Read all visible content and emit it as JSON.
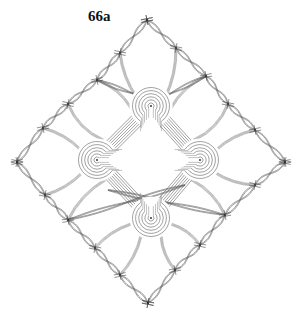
{
  "figure": {
    "label": "66a",
    "colors": {
      "background": "#ffffff",
      "thread": "#555555",
      "label": "#111111"
    }
  },
  "outline": {
    "top": [
      147,
      20
    ],
    "right": [
      285,
      162
    ],
    "bottom": [
      148,
      303
    ],
    "left": [
      17,
      162
    ]
  },
  "edges": {
    "top_right": [
      [
        147,
        20
      ],
      [
        176,
        48
      ],
      [
        206,
        76
      ],
      [
        228,
        104
      ],
      [
        255,
        130
      ],
      [
        285,
        162
      ]
    ],
    "top_left": [
      [
        147,
        20
      ],
      [
        120,
        53
      ],
      [
        97,
        80
      ],
      [
        68,
        104
      ],
      [
        43,
        128
      ],
      [
        17,
        162
      ]
    ],
    "bottom_left": [
      [
        17,
        162
      ],
      [
        45,
        195
      ],
      [
        68,
        220
      ],
      [
        95,
        248
      ],
      [
        120,
        275
      ],
      [
        148,
        303
      ]
    ],
    "bottom_right": [
      [
        285,
        162
      ],
      [
        255,
        185
      ],
      [
        225,
        215
      ],
      [
        200,
        245
      ],
      [
        175,
        270
      ],
      [
        148,
        303
      ]
    ]
  },
  "spiders": [
    {
      "name": "top",
      "cx": 151,
      "cy": 106,
      "rings": 6,
      "opening": "down"
    },
    {
      "name": "left",
      "cx": 97,
      "cy": 160,
      "rings": 6,
      "opening": "right"
    },
    {
      "name": "right",
      "cx": 200,
      "cy": 160,
      "rings": 6,
      "opening": "left"
    },
    {
      "name": "bottom",
      "cx": 151,
      "cy": 218,
      "rings": 6,
      "opening": "up"
    }
  ]
}
